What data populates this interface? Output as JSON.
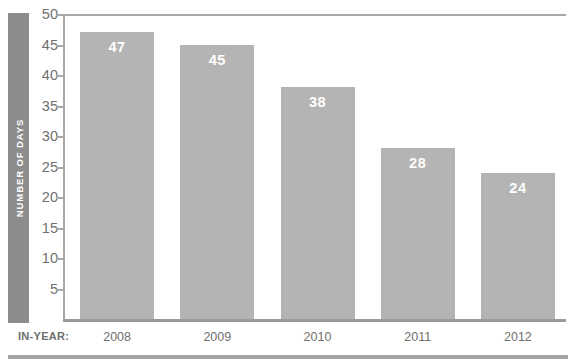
{
  "chart_data": {
    "type": "bar",
    "title": "",
    "xlabel": "IN-YEAR:",
    "ylabel": "NUMBER OF DAYS",
    "categories": [
      "2008",
      "2009",
      "2010",
      "2011",
      "2012"
    ],
    "values": [
      47,
      45,
      38,
      28,
      24
    ],
    "value_labels": [
      "47",
      "45",
      "38",
      "28",
      "24"
    ],
    "ylim": [
      0,
      50
    ],
    "ytick_labels": [
      "50",
      "45",
      "40",
      "35",
      "30",
      "25",
      "20",
      "15",
      "10",
      "5"
    ],
    "ytick_values": [
      50,
      45,
      40,
      35,
      30,
      25,
      20,
      15,
      10,
      5
    ],
    "grid": false,
    "legend": false,
    "legend_position": "none",
    "bar_color": "#b4b4b4",
    "axis_color": "#a8a8a8",
    "text_color": "#6f6f6f",
    "value_label_color": "#ffffff",
    "ylabel_band_color": "#8c8c8c"
  },
  "top_clipped_text": ""
}
